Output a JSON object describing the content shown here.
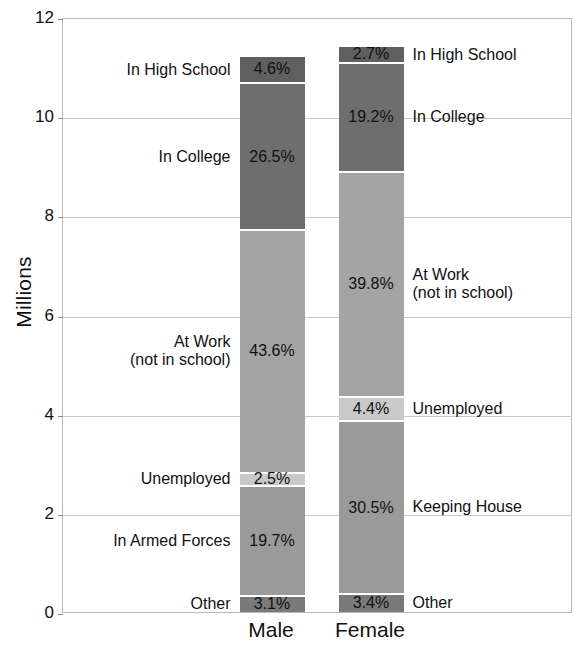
{
  "chart_data": {
    "type": "bar",
    "subtype": "stacked-bar",
    "title": "",
    "xlabel": "",
    "ylabel": "Millions",
    "ylim": [
      0,
      12
    ],
    "yticks": [
      0,
      2,
      4,
      6,
      8,
      10,
      12
    ],
    "ytick_labels": [
      "0",
      "2",
      "4",
      "6",
      "8",
      "10",
      "12"
    ],
    "grid": true,
    "legend": "inline-side-labels",
    "categories": [
      "Male",
      "Female"
    ],
    "totals_millions": [
      11.2,
      11.4
    ],
    "series": [
      {
        "name": "Male",
        "total_millions": 11.2,
        "segments": [
          {
            "label": "In High School",
            "percent": 4.6,
            "value_text": "4.6%",
            "color": "#5f5f5f",
            "shade": "dark"
          },
          {
            "label": "In College",
            "percent": 26.5,
            "value_text": "26.5%",
            "color": "#6e6e6e",
            "shade": "dark"
          },
          {
            "label": "At Work\n(not in school)",
            "percent": 43.6,
            "value_text": "43.6%",
            "color": "#a4a4a4",
            "shade": "light"
          },
          {
            "label": "Unemployed",
            "percent": 2.5,
            "value_text": "2.5%",
            "color": "#c9c9c9",
            "shade": "light"
          },
          {
            "label": "In Armed Forces",
            "percent": 19.7,
            "value_text": "19.7%",
            "color": "#9a9a9a",
            "shade": "light"
          },
          {
            "label": "Other",
            "percent": 3.1,
            "value_text": "3.1%",
            "color": "#7a7a7a",
            "shade": "dark"
          }
        ]
      },
      {
        "name": "Female",
        "total_millions": 11.4,
        "segments": [
          {
            "label": "In High School",
            "percent": 2.7,
            "value_text": "2.7%",
            "color": "#5f5f5f",
            "shade": "dark"
          },
          {
            "label": "In College",
            "percent": 19.2,
            "value_text": "19.2%",
            "color": "#6e6e6e",
            "shade": "dark"
          },
          {
            "label": "At Work\n(not in school)",
            "percent": 39.8,
            "value_text": "39.8%",
            "color": "#a4a4a4",
            "shade": "light"
          },
          {
            "label": "Unemployed",
            "percent": 4.4,
            "value_text": "4.4%",
            "color": "#c9c9c9",
            "shade": "light"
          },
          {
            "label": "Keeping House",
            "percent": 30.5,
            "value_text": "30.5%",
            "color": "#9a9a9a",
            "shade": "light"
          },
          {
            "label": "Other",
            "percent": 3.4,
            "value_text": "3.4%",
            "color": "#7a7a7a",
            "shade": "dark"
          }
        ]
      }
    ],
    "left_labels": [
      {
        "text": "In High School",
        "for_segment": 0
      },
      {
        "text": "In College",
        "for_segment": 1
      },
      {
        "text": "At Work\n(not in school)",
        "for_segment": 2
      },
      {
        "text": "Unemployed",
        "for_segment": 3
      },
      {
        "text": "In Armed Forces",
        "for_segment": 4
      },
      {
        "text": "Other",
        "for_segment": 5
      }
    ],
    "right_labels": [
      {
        "text": "In High School",
        "for_segment": 0
      },
      {
        "text": "In College",
        "for_segment": 1
      },
      {
        "text": "At Work\n(not in school)",
        "for_segment": 2
      },
      {
        "text": "Unemployed",
        "for_segment": 3
      },
      {
        "text": "Keeping House",
        "for_segment": 4
      },
      {
        "text": "Other",
        "for_segment": 5
      }
    ],
    "colors": {
      "in_high_school": "#5f5f5f",
      "in_college": "#6e6e6e",
      "at_work": "#a4a4a4",
      "unemployed": "#c9c9c9",
      "armed_forces_or_keeping_house": "#9a9a9a",
      "other": "#7a7a7a",
      "gridline": "#c9c9c9",
      "frame": "#b9b9b9",
      "background": "#ffffff",
      "text": "#111111"
    }
  }
}
